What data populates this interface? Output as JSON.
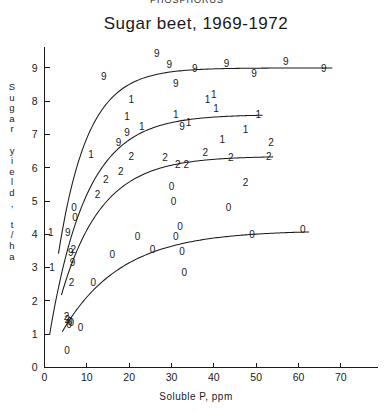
{
  "figure": {
    "cropped_header": "PHOSPHORUS",
    "title": "Sugar beet, 1969-1972",
    "xlabel": "Soluble P, ppm",
    "ylabel_chars": [
      "S",
      "u",
      "g",
      "a",
      "r",
      " ",
      "y",
      "i",
      "e",
      "l",
      "d",
      ",",
      " ",
      "t",
      "/",
      "h",
      "a"
    ]
  },
  "chart_data": {
    "type": "scatter",
    "title": "Sugar beet, 1969-1972",
    "xlabel": "Soluble P, ppm",
    "ylabel": "Sugar yield, t/ha",
    "xlim": [
      0,
      75
    ],
    "ylim": [
      0,
      9.6
    ],
    "xticks": [
      0,
      10,
      20,
      30,
      40,
      50,
      60,
      70
    ],
    "yticks": [
      0,
      1,
      2,
      3,
      4,
      5,
      6,
      7,
      8,
      9
    ],
    "grid": false,
    "legend": "none",
    "marker_encoding": "Each data point is plotted as the last digit of its harvest year: 9 = 1969, 0 = 1970, 1 = 1971, 2 = 1972",
    "series": [
      {
        "name": "1969",
        "marker": "9",
        "plateau": 9.0,
        "points": [
          {
            "x": 5.5,
            "y": 4.05
          },
          {
            "x": 6.2,
            "y": 3.45
          },
          {
            "x": 6.6,
            "y": 3.15
          },
          {
            "x": 14.0,
            "y": 8.75
          },
          {
            "x": 17.5,
            "y": 6.75
          },
          {
            "x": 19.5,
            "y": 7.05
          },
          {
            "x": 26.5,
            "y": 9.45
          },
          {
            "x": 29.5,
            "y": 9.1
          },
          {
            "x": 31.0,
            "y": 8.55
          },
          {
            "x": 32.5,
            "y": 7.25
          },
          {
            "x": 35.5,
            "y": 9.0
          },
          {
            "x": 43.0,
            "y": 9.15
          },
          {
            "x": 49.5,
            "y": 8.85
          },
          {
            "x": 57.0,
            "y": 9.2
          },
          {
            "x": 66.0,
            "y": 9.0
          }
        ]
      },
      {
        "name": "1971",
        "marker": "1",
        "plateau": 7.6,
        "points": [
          {
            "x": 1.5,
            "y": 4.05
          },
          {
            "x": 1.8,
            "y": 3.0
          },
          {
            "x": 11.0,
            "y": 6.4
          },
          {
            "x": 19.5,
            "y": 7.55
          },
          {
            "x": 20.5,
            "y": 8.05
          },
          {
            "x": 23.0,
            "y": 7.25
          },
          {
            "x": 31.0,
            "y": 7.6
          },
          {
            "x": 34.0,
            "y": 7.35
          },
          {
            "x": 38.5,
            "y": 8.05
          },
          {
            "x": 40.0,
            "y": 8.2
          },
          {
            "x": 40.5,
            "y": 7.8
          },
          {
            "x": 42.0,
            "y": 6.85
          },
          {
            "x": 47.5,
            "y": 7.15
          },
          {
            "x": 50.5,
            "y": 7.6
          }
        ]
      },
      {
        "name": "1972",
        "marker": "2",
        "plateau": 6.35,
        "points": [
          {
            "x": 5.2,
            "y": 1.55
          },
          {
            "x": 5.4,
            "y": 1.45
          },
          {
            "x": 6.4,
            "y": 2.55
          },
          {
            "x": 6.8,
            "y": 3.55
          },
          {
            "x": 12.5,
            "y": 5.2
          },
          {
            "x": 14.5,
            "y": 5.65
          },
          {
            "x": 18.0,
            "y": 5.9
          },
          {
            "x": 20.5,
            "y": 6.35
          },
          {
            "x": 28.5,
            "y": 6.3
          },
          {
            "x": 31.5,
            "y": 6.1
          },
          {
            "x": 33.5,
            "y": 6.1
          },
          {
            "x": 38.0,
            "y": 6.45
          },
          {
            "x": 44.0,
            "y": 6.3
          },
          {
            "x": 47.5,
            "y": 5.55
          },
          {
            "x": 53.0,
            "y": 6.35
          },
          {
            "x": 53.5,
            "y": 6.75
          }
        ]
      },
      {
        "name": "1970",
        "marker": "0",
        "plateau": 4.1,
        "points": [
          {
            "x": 5.3,
            "y": 0.5
          },
          {
            "x": 5.8,
            "y": 1.3
          },
          {
            "x": 6.0,
            "y": 1.4
          },
          {
            "x": 6.3,
            "y": 1.35
          },
          {
            "x": 7.0,
            "y": 4.8
          },
          {
            "x": 7.2,
            "y": 4.5
          },
          {
            "x": 8.5,
            "y": 1.2
          },
          {
            "x": 11.5,
            "y": 2.55
          },
          {
            "x": 16.0,
            "y": 3.4
          },
          {
            "x": 22.0,
            "y": 3.95
          },
          {
            "x": 25.5,
            "y": 3.55
          },
          {
            "x": 30.0,
            "y": 5.45
          },
          {
            "x": 30.5,
            "y": 5.0
          },
          {
            "x": 31.0,
            "y": 3.95
          },
          {
            "x": 32.0,
            "y": 4.25
          },
          {
            "x": 32.5,
            "y": 3.5
          },
          {
            "x": 33.0,
            "y": 2.85
          },
          {
            "x": 43.5,
            "y": 4.8
          },
          {
            "x": 49.0,
            "y": 4.0
          },
          {
            "x": 61.0,
            "y": 4.15
          }
        ]
      }
    ],
    "fitted_curves": [
      {
        "name": "1969",
        "asymptote": 9.0,
        "intercept": 0.0,
        "rate": 0.145,
        "xstart": 3.3,
        "xend": 68.0
      },
      {
        "name": "1971",
        "asymptote": 7.6,
        "intercept": 0.0,
        "rate": 0.115,
        "xstart": 1.2,
        "xend": 51.5
      },
      {
        "name": "1972",
        "asymptote": 6.35,
        "intercept": 0.0,
        "rate": 0.105,
        "xstart": 4.0,
        "xend": 54.0
      },
      {
        "name": "1970",
        "asymptote": 4.12,
        "intercept": 0.0,
        "rate": 0.072,
        "xstart": 4.2,
        "xend": 62.5
      }
    ]
  }
}
